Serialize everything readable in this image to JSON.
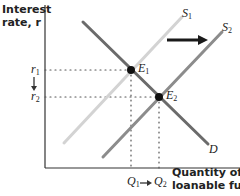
{
  "diagram": {
    "type": "supply-demand-loanable-funds",
    "y_axis_title_line1": "Interest",
    "y_axis_title_line2": "rate, r",
    "x_axis_title_line1": "Quantity of",
    "x_axis_title_line2": "loanable funds",
    "curves": {
      "demand": {
        "label": "D",
        "color": "#6b6b6b"
      },
      "supply1": {
        "label": "S",
        "sub": "1",
        "color": "#d3d3d3"
      },
      "supply2": {
        "label": "S",
        "sub": "2",
        "color": "#8c8c8c"
      }
    },
    "points": {
      "e1": {
        "label": "E",
        "sub": "1"
      },
      "e2": {
        "label": "E",
        "sub": "2"
      }
    },
    "y_ticks": {
      "r1": {
        "label": "r",
        "sub": "1"
      },
      "r2": {
        "label": "r",
        "sub": "2"
      }
    },
    "x_ticks": {
      "q1": {
        "label": "Q",
        "sub": "1"
      },
      "q2": {
        "label": "Q",
        "sub": "2"
      }
    },
    "shift_arrow": "rightward shift of supply from S1 to S2",
    "colors": {
      "axis": "#333333",
      "arrow": "#1a1a1a",
      "dots": "#555555"
    }
  }
}
